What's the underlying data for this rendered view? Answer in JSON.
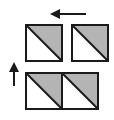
{
  "diagram": {
    "colors": {
      "background": "#ffffff",
      "stroke": "#1a1a1a",
      "shade": "#b4b4b4"
    },
    "tiles": [
      {
        "id": "top-left",
        "x": 26,
        "y": 25,
        "size": 36,
        "shaded_half": "upper-right"
      },
      {
        "id": "top-right",
        "x": 72,
        "y": 25,
        "size": 36,
        "shaded_half": "upper-right"
      },
      {
        "id": "bottom-left",
        "x": 26,
        "y": 73,
        "size": 36,
        "shaded_half": "upper-right"
      },
      {
        "id": "bottom-right",
        "x": 62,
        "y": 73,
        "size": 36,
        "shaded_half": "upper-right"
      }
    ],
    "arrows": [
      {
        "id": "arrow-left",
        "direction": "left",
        "x1": 86,
        "y1": 14,
        "x2": 50,
        "y2": 14
      },
      {
        "id": "arrow-up",
        "direction": "up",
        "x1": 14,
        "y1": 86,
        "x2": 14,
        "y2": 62
      }
    ]
  }
}
